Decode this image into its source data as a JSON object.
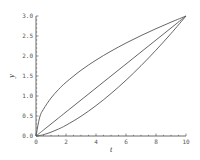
{
  "chart_data": {
    "type": "line",
    "title": "",
    "xlabel": "t",
    "ylabel": "y",
    "xlim": [
      0,
      10
    ],
    "ylim": [
      0,
      3.0
    ],
    "xticks": [
      "0",
      "2",
      "4",
      "6",
      "8",
      "10"
    ],
    "yticks": [
      "0.0",
      "0.5",
      "1.0",
      "1.5",
      "2.0",
      "2.5",
      "3.0"
    ],
    "grid": false,
    "legend": null,
    "x": [
      0,
      0.25,
      0.5,
      1,
      1.5,
      2,
      3,
      4,
      5,
      6,
      7,
      8,
      9,
      10
    ],
    "series": [
      {
        "name": "upper (concave)",
        "values": [
          0,
          0.474,
          0.671,
          0.949,
          1.162,
          1.342,
          1.643,
          1.897,
          2.121,
          2.324,
          2.51,
          2.683,
          2.846,
          3.0
        ]
      },
      {
        "name": "linear",
        "values": [
          0,
          0.075,
          0.15,
          0.3,
          0.45,
          0.6,
          0.9,
          1.2,
          1.5,
          1.8,
          2.1,
          2.4,
          2.7,
          3.0
        ]
      },
      {
        "name": "lower (convex)",
        "values": [
          0,
          0.012,
          0.034,
          0.095,
          0.174,
          0.268,
          0.493,
          0.759,
          1.061,
          1.394,
          1.757,
          2.147,
          2.561,
          3.0
        ]
      }
    ],
    "color": "#555555"
  }
}
